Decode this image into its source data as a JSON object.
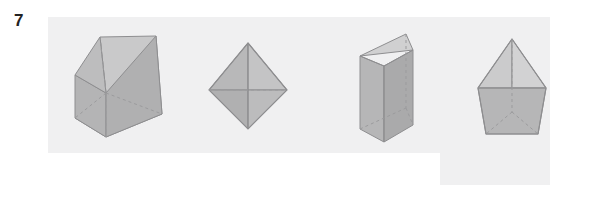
{
  "exercise": {
    "number": "7",
    "number_label": "7"
  },
  "panels": {
    "main": {
      "name": "figure-strip-background"
    },
    "tail": {
      "name": "figure-strip-background-tail"
    }
  },
  "palette": {
    "page_background": "#ffffff",
    "panel_background": "#f0f0f1",
    "number_color": "#232323",
    "solid_face_light": "#cfcfd0",
    "solid_face_mid": "#b9b9ba",
    "solid_face_dark": "#a9a9aa",
    "solid_face_darker": "#9e9e9f",
    "edge_color": "#8e8e90",
    "hidden_edge_color": "#a0a0a2"
  },
  "figures": [
    {
      "index": 1,
      "id": "triangular-prism-wedge",
      "name": "Triangular prism (wedge resting on rectangular face)",
      "faces_visible": 3,
      "hidden_edges": true
    },
    {
      "index": 2,
      "id": "octahedron",
      "name": "Octahedron (two square pyramids joined base to base)",
      "faces_visible": 4,
      "hidden_edges": true
    },
    {
      "index": 3,
      "id": "triangular-prism-upright",
      "name": "Triangular prism standing upright",
      "faces_visible": 3,
      "hidden_edges": true
    },
    {
      "index": 4,
      "id": "pentagonal-solid-with-pyramid",
      "name": "Pyramid on pentagonal body",
      "faces_visible": 4,
      "hidden_edges": true
    }
  ]
}
